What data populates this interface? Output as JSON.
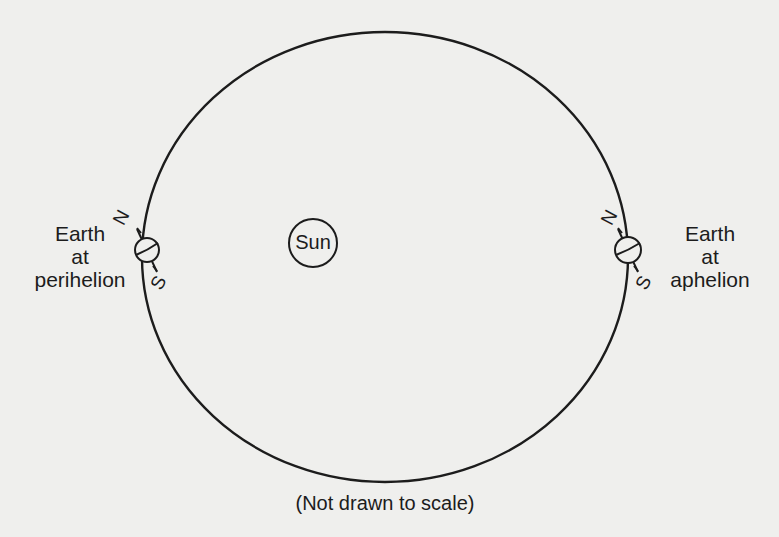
{
  "diagram": {
    "sun_label": "Sun",
    "caption": "(Not drawn to scale)",
    "left_earth": {
      "line1": "Earth",
      "line2": "at",
      "line3": "perihelion",
      "north": "N",
      "south": "S"
    },
    "right_earth": {
      "line1": "Earth",
      "line2": "at",
      "line3": "aphelion",
      "north": "N",
      "south": "S"
    },
    "colors": {
      "background": "#efefed",
      "ink": "#1c1c1c"
    }
  }
}
